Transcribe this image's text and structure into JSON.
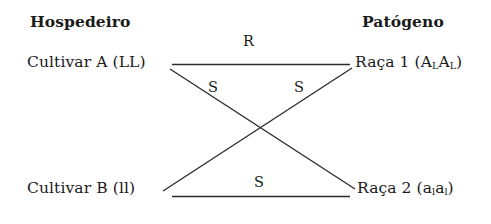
{
  "diagram": {
    "columns": {
      "host_header": "Hospedeiro",
      "pathogen_header": "Patógeno"
    },
    "nodes": {
      "host_top": "Cultivar A (LL)",
      "host_bottom": "Cultivar B (ll)",
      "pathogen_top_prefix": "Raça 1 (A",
      "pathogen_top_sub1": "L",
      "pathogen_top_mid": "A",
      "pathogen_top_sub2": "L",
      "pathogen_top_suffix": ")",
      "pathogen_bottom_prefix": "Raça 2 (a",
      "pathogen_bottom_sub1": "l",
      "pathogen_bottom_mid": "a",
      "pathogen_bottom_sub2": "l",
      "pathogen_bottom_suffix": ")"
    },
    "edges": {
      "top_horizontal": "R",
      "diagonal_left": "S",
      "diagonal_right": "S",
      "bottom_horizontal": "S"
    },
    "colors": {
      "background": "#ffffff",
      "text": "#1a1a1a",
      "line": "#2b2b2b"
    }
  }
}
